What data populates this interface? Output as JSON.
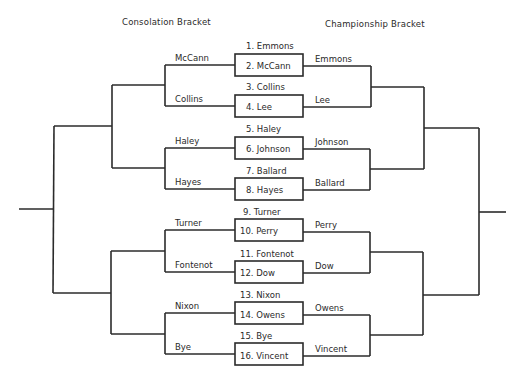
{
  "headers": {
    "consolation": "Consolation Bracket",
    "championship": "Championship Bracket"
  },
  "first_round": [
    {
      "top": "1. Emmons",
      "bottom": "2. McCann"
    },
    {
      "top": "3. Collins",
      "bottom": "4. Lee"
    },
    {
      "top": "5. Haley",
      "bottom": "6. Johnson"
    },
    {
      "top": "7. Ballard",
      "bottom": "8. Hayes"
    },
    {
      "top": "9. Turner",
      "bottom": "10. Perry"
    },
    {
      "top": "11. Fontenot",
      "bottom": "12. Dow"
    },
    {
      "top": "13. Nixon",
      "bottom": "14. Owens"
    },
    {
      "top": "15. Bye",
      "bottom": "16. Vincent"
    }
  ],
  "consolation_round1": [
    "McCann",
    "Collins",
    "Haley",
    "Hayes",
    "Turner",
    "Fontenot",
    "Nixon",
    "Bye"
  ],
  "championship_round1": [
    "Emmons",
    "Lee",
    "Johnson",
    "Ballard",
    "Perry",
    "Dow",
    "Owens",
    "Vincent"
  ],
  "colors": {
    "line": "#2b2b2b",
    "text": "#2a2a2a",
    "background": "#ffffff"
  }
}
